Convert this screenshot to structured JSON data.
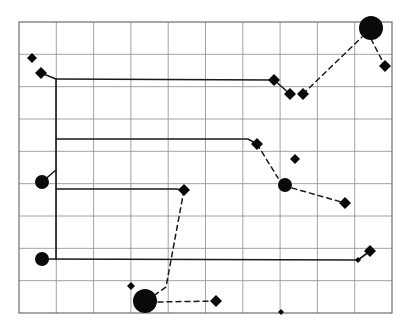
{
  "figure": {
    "title": "",
    "background_color": "#ffffff",
    "grid": {
      "x0": 19,
      "y0": 22,
      "x1": 392,
      "y1": 313,
      "cols": 10,
      "rows": 9,
      "line_color": "#8c8c8c",
      "border_color": "#6e6e6e",
      "line_width": 0.8,
      "border_width": 1.2,
      "visible": true
    },
    "styles": {
      "marker_color": "#0a0a0a",
      "solid_line_color": "#1a1a1a",
      "dashed_line_color": "#1a1a1a",
      "solid_line_width": 1.6,
      "dashed_line_width": 1.5,
      "dash_pattern": "5 4"
    },
    "markers": [
      {
        "id": "d1",
        "name": "diamond-small-top-left",
        "type": "diamond",
        "x": 32,
        "y": 58,
        "size": 5
      },
      {
        "id": "d2",
        "name": "diamond-upper-left",
        "type": "diamond",
        "x": 41,
        "y": 73,
        "size": 6
      },
      {
        "id": "c1",
        "name": "circle-left-middle",
        "type": "circle",
        "x": 42,
        "y": 182,
        "size": 7
      },
      {
        "id": "c2",
        "name": "circle-left-lower",
        "type": "circle",
        "x": 42,
        "y": 259,
        "size": 7
      },
      {
        "id": "d3",
        "name": "diamond-center",
        "type": "diamond",
        "x": 184,
        "y": 190,
        "size": 6
      },
      {
        "id": "d4",
        "name": "diamond-small-bottom-left",
        "type": "diamond",
        "x": 131,
        "y": 286,
        "size": 4
      },
      {
        "id": "c3",
        "name": "circle-bottom-large",
        "type": "circle",
        "x": 145,
        "y": 301,
        "size": 12
      },
      {
        "id": "d5",
        "name": "diamond-bottom-center",
        "type": "diamond",
        "x": 216,
        "y": 301,
        "size": 6
      },
      {
        "id": "d6",
        "name": "diamond-small-bottom-axis",
        "type": "diamond",
        "x": 281,
        "y": 312,
        "size": 3
      },
      {
        "id": "d7",
        "name": "diamond-mid-right-upper",
        "type": "diamond",
        "x": 257,
        "y": 144,
        "size": 6
      },
      {
        "id": "d8",
        "name": "diamond-small-mid-right",
        "type": "diamond",
        "x": 295,
        "y": 159,
        "size": 5
      },
      {
        "id": "c4",
        "name": "circle-mid-right",
        "type": "circle",
        "x": 285,
        "y": 185,
        "size": 7
      },
      {
        "id": "d9",
        "name": "diamond-right-lower",
        "type": "diamond",
        "x": 345,
        "y": 203,
        "size": 6
      },
      {
        "id": "d10",
        "name": "diamond-bottom-right",
        "type": "diamond",
        "x": 370,
        "y": 251,
        "size": 6
      },
      {
        "id": "d11",
        "name": "diamond-small-bottom-right",
        "type": "diamond",
        "x": 358,
        "y": 260,
        "size": 3
      },
      {
        "id": "d12",
        "name": "diamond-top-line-end",
        "type": "diamond",
        "x": 274,
        "y": 80,
        "size": 6
      },
      {
        "id": "d13",
        "name": "diamond-top-dip-left",
        "type": "diamond",
        "x": 290,
        "y": 94,
        "size": 6
      },
      {
        "id": "d14",
        "name": "diamond-top-dip-right",
        "type": "diamond",
        "x": 303,
        "y": 94,
        "size": 6
      },
      {
        "id": "c5",
        "name": "circle-top-right-large",
        "type": "circle",
        "x": 371,
        "y": 28,
        "size": 12
      },
      {
        "id": "d15",
        "name": "diamond-upper-right",
        "type": "diamond",
        "x": 385,
        "y": 66,
        "size": 6
      }
    ],
    "solid_paths": [
      {
        "name": "path-left-trunk",
        "points": [
          [
            41,
            73
          ],
          [
            56,
            79
          ],
          [
            56,
            259
          ]
        ]
      },
      {
        "name": "path-top-horizontal",
        "points": [
          [
            56,
            79
          ],
          [
            274,
            80
          ]
        ]
      },
      {
        "name": "path-second-horizontal",
        "points": [
          [
            56,
            139
          ],
          [
            248,
            139
          ],
          [
            257,
            144
          ]
        ]
      },
      {
        "name": "path-circle-left-middle-stub",
        "points": [
          [
            42,
            182
          ],
          [
            56,
            170
          ]
        ]
      },
      {
        "name": "path-third-horizontal",
        "points": [
          [
            56,
            189
          ],
          [
            176,
            189
          ],
          [
            184,
            190
          ]
        ]
      },
      {
        "name": "path-bottom-horizontal",
        "points": [
          [
            42,
            259
          ],
          [
            358,
            260
          ]
        ]
      },
      {
        "name": "path-bottom-right-stub",
        "points": [
          [
            358,
            260
          ],
          [
            370,
            251
          ]
        ]
      },
      {
        "name": "path-top-dip-stub",
        "points": [
          [
            274,
            80
          ],
          [
            290,
            94
          ]
        ]
      }
    ],
    "dashed_paths": [
      {
        "name": "dashed-top-right-ascent",
        "points": [
          [
            303,
            94
          ],
          [
            362,
            37
          ]
        ]
      },
      {
        "name": "dashed-top-right-descent",
        "points": [
          [
            371,
            39
          ],
          [
            385,
            66
          ]
        ]
      },
      {
        "name": "dashed-mid-right-descent",
        "points": [
          [
            257,
            144
          ],
          [
            278,
            178
          ]
        ]
      },
      {
        "name": "dashed-mid-right-to-lower",
        "points": [
          [
            292,
            188
          ],
          [
            345,
            203
          ]
        ]
      },
      {
        "name": "dashed-center-to-bottom",
        "points": [
          [
            184,
            190
          ],
          [
            166,
            287
          ],
          [
            152,
            297
          ]
        ]
      },
      {
        "name": "dashed-bottom-run",
        "points": [
          [
            158,
            302
          ],
          [
            216,
            301
          ]
        ]
      }
    ]
  }
}
